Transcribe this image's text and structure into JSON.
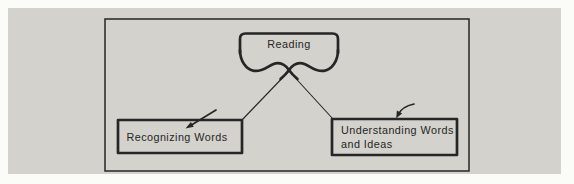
{
  "diagram": {
    "root": {
      "label": "Reading"
    },
    "nodes": [
      {
        "id": "recognizing-words",
        "label": "Recognizing Words"
      },
      {
        "id": "understanding-words",
        "label_line1": "Understanding Words",
        "label_line2": "and Ideas"
      }
    ]
  },
  "colors": {
    "panel_bg": "#d4d2cc",
    "page_bg": "#fbfbf8",
    "ink": "#262626"
  }
}
